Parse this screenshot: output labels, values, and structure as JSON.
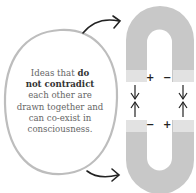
{
  "caption": {
    "line1_normal": "Ideas that ",
    "line1_bold": "do",
    "line2_bold": "not contradict",
    "line3": "each other are",
    "line4": "drawn together and",
    "line5": "can co-exist in",
    "line6": "consciousness."
  },
  "magnets": {
    "top": {
      "left_pole": "+",
      "right_pole": "−"
    },
    "bottom": {
      "left_pole": "−",
      "right_pole": "+"
    }
  },
  "colors": {
    "magnet_body": "#c8c8c8",
    "pole": "#e2e2e2",
    "bubble_outline": "#bdbdbd",
    "arrow": "#222222"
  }
}
